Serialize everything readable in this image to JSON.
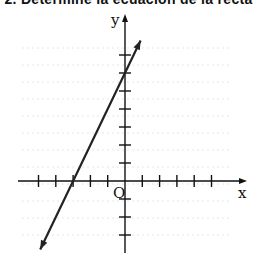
{
  "header": {
    "title": "2. Determine la ecuación de la recta"
  },
  "chart_data": {
    "type": "line",
    "title": "",
    "xlabel": "x",
    "ylabel": "y",
    "origin_label": "O",
    "x_ticks": [
      -5,
      -4,
      -3,
      -2,
      -1,
      1,
      2,
      3,
      4,
      5
    ],
    "y_ticks": [
      -3,
      -2,
      -1,
      1,
      2,
      3,
      4,
      5,
      6,
      7
    ],
    "xlim": [
      -5.5,
      7
    ],
    "ylim": [
      -4,
      9
    ],
    "grid": false,
    "series": [
      {
        "name": "line",
        "equation": "y = 2x + 6",
        "x": [
          -4.9,
          -3,
          0,
          0.9
        ],
        "y": [
          -3.8,
          0,
          6,
          7.8
        ],
        "x_intercept": -3,
        "y_intercept": 6,
        "slope": 2
      }
    ],
    "colors": {
      "axis": "#111111",
      "line": "#222222"
    }
  }
}
